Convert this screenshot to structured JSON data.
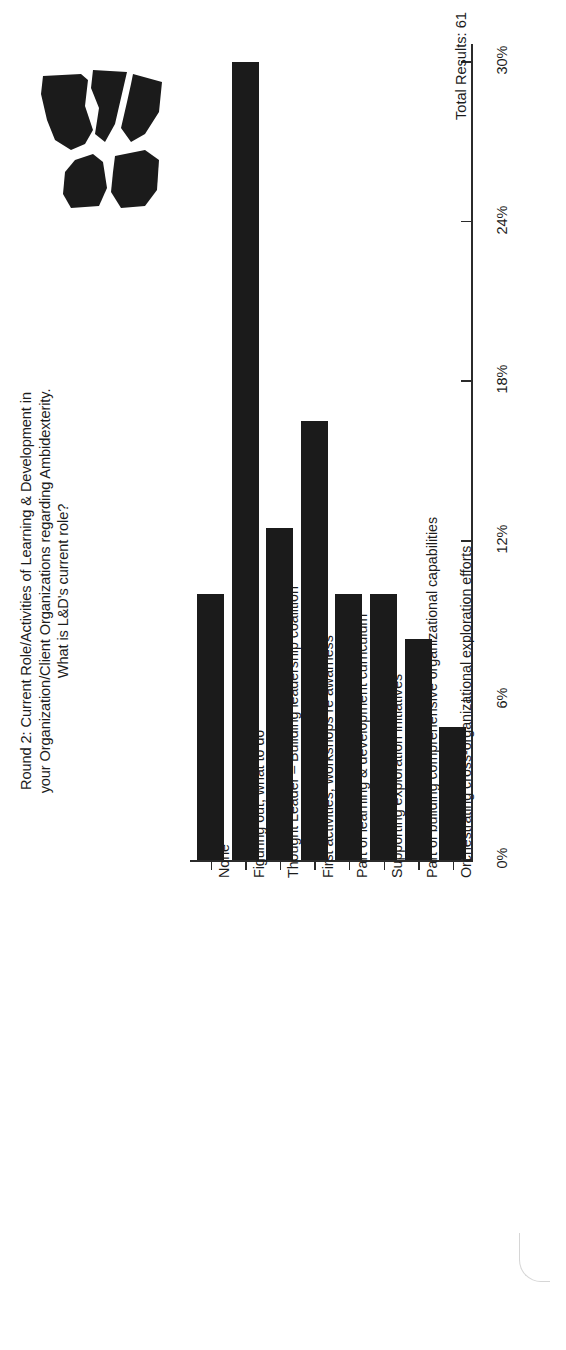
{
  "logo": {
    "name": "organization-logo-mark",
    "color": "#1b1b1b"
  },
  "title": {
    "line1": "Round 2: Current Role/Activities of Learning & Development in",
    "line2": "your Organization/Client Organizations regarding Ambidexterity.",
    "line3": "What is L&D's current role?"
  },
  "footer": {
    "total_results": "Total Results: 61"
  },
  "colors": {
    "bar": "#1b1b1b",
    "axis": "#2b2b2b",
    "text": "#1c1c1c",
    "background": "#ffffff"
  },
  "chart_data": {
    "type": "bar",
    "orientation": "vertical-rotated",
    "title": "Round 2: Current Role/Activities of Learning & Development in your Organization/Client Organizations regarding Ambidexterity. What is L&D's current role?",
    "xlabel": "",
    "ylabel": "",
    "ylim": [
      0,
      30
    ],
    "grid": false,
    "legend": null,
    "total_results": 61,
    "tick_labels": [
      "0%",
      "6%",
      "12%",
      "18%",
      "24%",
      "30%"
    ],
    "tick_values": [
      0,
      6,
      12,
      18,
      24,
      30
    ],
    "categories": [
      "None",
      "Figuring out, what to do",
      "Thought Leader – Building leadership coalition",
      "First activities, workshops re awarness",
      "Part of learning & development curriculum",
      "Supporting exploration initiatives",
      "Part of building comprehensive organizational capabilities",
      "Orchestrating cross-organizational exploration efforts"
    ],
    "values": [
      10.0,
      30.0,
      12.5,
      16.5,
      10.0,
      10.0,
      8.3,
      5.0
    ],
    "value_labels": [
      "10%",
      "30%",
      "12.5%",
      "16.5%",
      "10%",
      "10%",
      "8.3%",
      "5%"
    ]
  }
}
